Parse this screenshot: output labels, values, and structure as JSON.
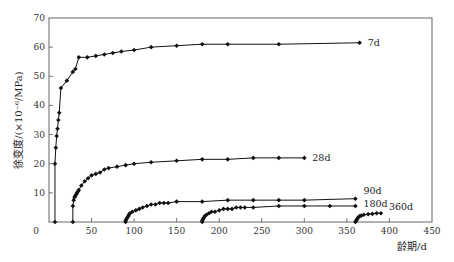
{
  "chart_data": {
    "type": "line",
    "title": "",
    "xlabel": "龄期/d",
    "ylabel": "徐变度/(×10⁻⁶/MPa)",
    "xlim": [
      0,
      450
    ],
    "ylim": [
      0,
      70
    ],
    "xticks": [
      0,
      50,
      100,
      150,
      200,
      250,
      300,
      350,
      400,
      450
    ],
    "yticks": [
      0,
      10,
      20,
      30,
      40,
      50,
      60,
      70
    ],
    "grid": false,
    "legend": "inline labels at curve ends",
    "marker": "diamond",
    "series": [
      {
        "name": "7d",
        "x": [
          7,
          7,
          8,
          9,
          10,
          11,
          12,
          14,
          21,
          28,
          31,
          35,
          45,
          55,
          65,
          75,
          85,
          100,
          120,
          150,
          180,
          210,
          270,
          365
        ],
        "y": [
          0,
          20,
          25.5,
          29.5,
          32,
          35,
          37.5,
          46,
          48.5,
          51.5,
          52.5,
          56.5,
          56.5,
          57,
          57.5,
          58,
          58.5,
          59,
          60,
          60.5,
          61,
          61,
          61,
          61.5
        ]
      },
      {
        "name": "28d",
        "x": [
          28,
          28,
          29,
          30,
          31,
          32,
          33,
          34,
          35,
          38,
          42,
          46,
          50,
          55,
          60,
          65,
          70,
          80,
          90,
          100,
          120,
          150,
          180,
          210,
          240,
          270,
          300
        ],
        "y": [
          0,
          5.5,
          7.5,
          8.5,
          9,
          9.5,
          10,
          10.5,
          11,
          12.5,
          14,
          15,
          16,
          16.5,
          17,
          18,
          18.5,
          19,
          19.5,
          20,
          20.5,
          21,
          21.5,
          21.5,
          22,
          22,
          22
        ]
      },
      {
        "name": "90d",
        "x": [
          90,
          90,
          91,
          92,
          93,
          94,
          95,
          98,
          102,
          106,
          110,
          115,
          120,
          125,
          130,
          135,
          140,
          150,
          180,
          210,
          240,
          270,
          300,
          360
        ],
        "y": [
          0,
          0.5,
          1,
          1.5,
          2,
          2.5,
          3,
          3.5,
          4,
          4.5,
          5,
          5.5,
          6,
          6,
          6.5,
          6.5,
          6.5,
          7,
          7,
          7.5,
          7.5,
          7.5,
          7.5,
          8
        ]
      },
      {
        "name": "180d",
        "x": [
          180,
          180,
          181,
          182,
          183,
          185,
          188,
          191,
          195,
          200,
          205,
          210,
          215,
          220,
          225,
          230,
          240,
          270,
          300,
          330,
          360
        ],
        "y": [
          0,
          0.5,
          1,
          1.5,
          2,
          2.5,
          3,
          3.5,
          3.5,
          4,
          4.5,
          4.5,
          4.5,
          5,
          5,
          5,
          5,
          5.5,
          5.5,
          5.5,
          5.5
        ]
      },
      {
        "name": "360d",
        "x": [
          360,
          361,
          362,
          363,
          365,
          367,
          370,
          375,
          380,
          385,
          390
        ],
        "y": [
          0,
          0.5,
          1,
          1.5,
          2,
          2.2,
          2.5,
          2.7,
          2.8,
          3,
          3
        ]
      }
    ]
  },
  "axes": {
    "xlabel": "龄期/d",
    "ylabel": "徐变度/(×10⁻⁶/MPa)"
  }
}
